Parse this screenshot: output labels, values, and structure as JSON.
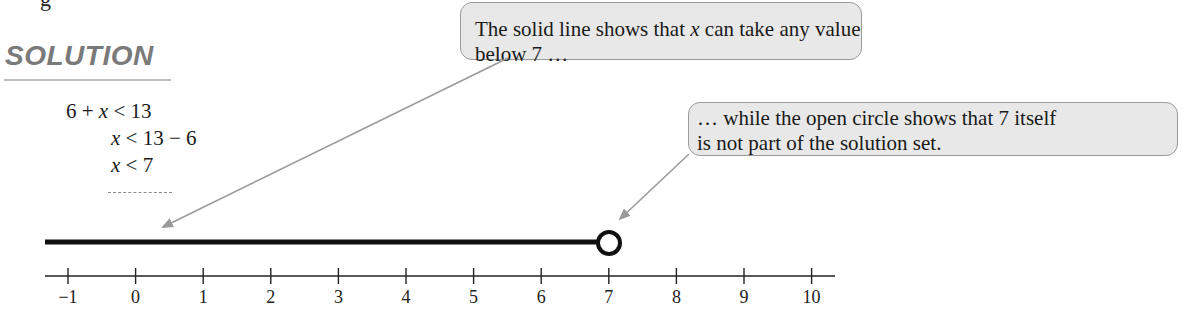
{
  "fragment_top": "g",
  "heading": "SOLUTION",
  "equations": [
    {
      "lhs": "6 + ",
      "var": "x",
      "rhs": " < 13"
    },
    {
      "lhs": "",
      "var": "x",
      "rhs": " < 13 − 6"
    },
    {
      "lhs": "",
      "var": "x",
      "rhs": " < 7"
    }
  ],
  "callouts": [
    {
      "pre": "The solid line shows that ",
      "var": "x",
      "post": " can take any value below 7 …"
    },
    {
      "line1": "… while the open circle shows that 7 itself",
      "line2": "is not part of the solution set."
    }
  ],
  "number_line": {
    "min": -1,
    "max": 10,
    "ticks": [
      "−1",
      "0",
      "1",
      "2",
      "3",
      "4",
      "5",
      "6",
      "7",
      "8",
      "9",
      "10"
    ],
    "solution_endpoint": 7,
    "endpoint_type": "open-circle",
    "shaded_direction": "left"
  },
  "colors": {
    "heading": "#7a7a7a",
    "callout_bg": "#e8e8e8",
    "callout_border": "#9a9a9a",
    "arrow": "#9a9a9a",
    "solution_line": "#111111"
  }
}
